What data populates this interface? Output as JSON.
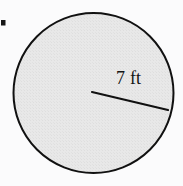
{
  "figure": {
    "name": "shaded-circle-with-radius",
    "type": "geometry-diagram",
    "shape": "circle",
    "background_color": "#fbfbfc"
  },
  "bullet": {
    "marker": "item-bullet",
    "color": "#161616"
  },
  "circle": {
    "label": "circle",
    "fill_color": "#e6e6e6",
    "stroke_color": "#111111",
    "stroke_width": 2,
    "center_x": 93,
    "center_y": 93,
    "radius_px": 80
  },
  "radius": {
    "label": "7 ft",
    "value": 7,
    "unit": "ft",
    "stroke_color": "#111111",
    "stroke_width": 2,
    "start_x": 92,
    "start_y": 92,
    "end_x": 168,
    "end_y": 110
  }
}
